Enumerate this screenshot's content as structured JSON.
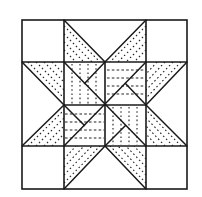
{
  "diagram": {
    "title": "",
    "type": "quilt-block-eight-point-star",
    "grid": {
      "x": [
        22,
        64,
        105,
        146,
        187
      ],
      "y": [
        20,
        62,
        105,
        146,
        189
      ]
    },
    "colors": {
      "line": "#1a1a1a",
      "background": "#ffffff"
    },
    "regions": [
      {
        "name": "corner-top-left",
        "fill": "blank"
      },
      {
        "name": "top-star-points",
        "fill": "diagonal-dots"
      },
      {
        "name": "corner-top-right",
        "fill": "blank"
      },
      {
        "name": "left-star-points",
        "fill": "diagonal-dots"
      },
      {
        "name": "center-top-left",
        "fill": "vertical-dashes"
      },
      {
        "name": "center-top-right",
        "fill": "horizontal-dashes"
      },
      {
        "name": "center-bottom-left",
        "fill": "horizontal-dashes"
      },
      {
        "name": "center-bottom-right",
        "fill": "vertical-dashes"
      },
      {
        "name": "right-star-points",
        "fill": "diagonal-dots"
      },
      {
        "name": "corner-bottom-left",
        "fill": "blank"
      },
      {
        "name": "bottom-star-points",
        "fill": "diagonal-dots"
      },
      {
        "name": "corner-bottom-right",
        "fill": "blank"
      }
    ]
  }
}
